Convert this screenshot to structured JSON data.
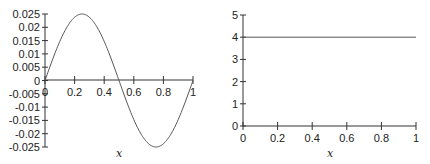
{
  "chart_data": [
    {
      "type": "line",
      "title": "",
      "xlabel": "x",
      "ylabel": "",
      "xlim": [
        0,
        1
      ],
      "ylim": [
        -0.025,
        0.025
      ],
      "xticks": [
        "0",
        "0.2",
        "0.4",
        "0.6",
        "0.8",
        "1"
      ],
      "yticks": [
        "0.025",
        "0.02",
        "0.015",
        "0.01",
        "0.005",
        "0",
        "-0.005",
        "-0.01",
        "-0.015",
        "-0.02",
        "-0.025"
      ],
      "grid": false,
      "legend": null,
      "series": [
        {
          "name": "curve",
          "function": "0.025*sin(2*pi*x)",
          "x": [
            0,
            0.05,
            0.1,
            0.15,
            0.2,
            0.25,
            0.3,
            0.35,
            0.4,
            0.45,
            0.5,
            0.55,
            0.6,
            0.65,
            0.7,
            0.75,
            0.8,
            0.85,
            0.9,
            0.95,
            1.0
          ],
          "y": [
            0,
            0.0077,
            0.0147,
            0.0202,
            0.0238,
            0.025,
            0.0238,
            0.0202,
            0.0147,
            0.0077,
            0,
            -0.0077,
            -0.0147,
            -0.0202,
            -0.0238,
            -0.025,
            -0.0238,
            -0.0202,
            -0.0147,
            -0.0077,
            0
          ]
        }
      ]
    },
    {
      "type": "line",
      "title": "",
      "xlabel": "x",
      "ylabel": "",
      "xlim": [
        0,
        1
      ],
      "ylim": [
        0,
        5
      ],
      "xticks": [
        "0",
        "0.2",
        "0.4",
        "0.6",
        "0.8",
        "1"
      ],
      "yticks": [
        "5",
        "4",
        "3",
        "2",
        "1",
        "0"
      ],
      "grid": false,
      "legend": null,
      "series": [
        {
          "name": "constant",
          "x": [
            0,
            1
          ],
          "y": [
            4,
            4
          ]
        }
      ]
    }
  ],
  "left": {
    "xlabel": "x",
    "xticks": [
      "0",
      "0.2",
      "0.4",
      "0.6",
      "0.8",
      "1"
    ],
    "yticks": [
      "0.025",
      "0.02",
      "0.015",
      "0.01",
      "0.005",
      "0",
      "-0.005",
      "-0.01",
      "-0.015",
      "-0.02",
      "-0.025"
    ]
  },
  "right": {
    "xlabel": "x",
    "xticks": [
      "0",
      "0.2",
      "0.4",
      "0.6",
      "0.8",
      "1"
    ],
    "yticks": [
      "5",
      "4",
      "3",
      "2",
      "1",
      "0"
    ]
  }
}
